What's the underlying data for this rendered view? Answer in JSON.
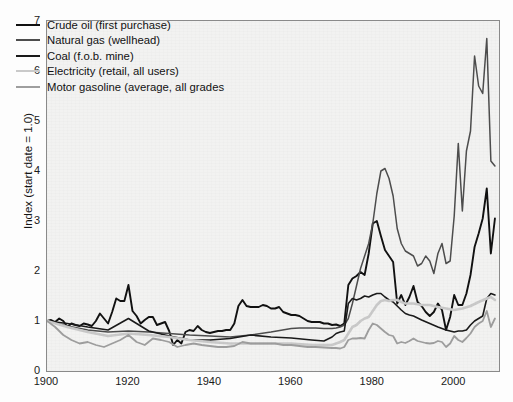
{
  "chart_data": {
    "type": "line",
    "title": "",
    "xlabel": "",
    "ylabel": "Index (start date = 1.0)",
    "xlim": [
      1900,
      2011
    ],
    "ylim": [
      0,
      7
    ],
    "xticks": [
      1900,
      1920,
      1940,
      1960,
      1980,
      2000
    ],
    "yticks": [
      0,
      1,
      2,
      3,
      4,
      5,
      6,
      7
    ],
    "grid": false,
    "legend_position": "upper left",
    "background_color": "#f2f2f1",
    "series": [
      {
        "name": "Crude oil (first purchase)",
        "color": "#111111",
        "width": 1.9,
        "x": [
          1900,
          1901,
          1902,
          1903,
          1904,
          1905,
          1906,
          1907,
          1908,
          1909,
          1910,
          1911,
          1912,
          1913,
          1914,
          1915,
          1916,
          1917,
          1918,
          1919,
          1920,
          1921,
          1922,
          1923,
          1924,
          1925,
          1926,
          1927,
          1928,
          1929,
          1930,
          1931,
          1932,
          1933,
          1934,
          1935,
          1936,
          1937,
          1938,
          1939,
          1940,
          1941,
          1942,
          1943,
          1944,
          1945,
          1946,
          1947,
          1948,
          1949,
          1950,
          1951,
          1952,
          1953,
          1954,
          1955,
          1956,
          1957,
          1958,
          1959,
          1960,
          1961,
          1962,
          1963,
          1964,
          1965,
          1966,
          1967,
          1968,
          1969,
          1970,
          1971,
          1972,
          1973,
          1974,
          1975,
          1976,
          1977,
          1978,
          1979,
          1980,
          1981,
          1982,
          1983,
          1984,
          1985,
          1986,
          1987,
          1988,
          1989,
          1990,
          1991,
          1992,
          1993,
          1994,
          1995,
          1996,
          1997,
          1998,
          1999,
          2000,
          2001,
          2002,
          2003,
          2004,
          2005,
          2006,
          2007,
          2008,
          2009,
          2010
        ],
        "values": [
          1.0,
          1.02,
          0.98,
          1.05,
          1.0,
          0.88,
          0.95,
          0.92,
          0.9,
          0.95,
          0.93,
          0.9,
          1.0,
          1.15,
          1.05,
          0.95,
          1.18,
          1.45,
          1.4,
          1.4,
          1.72,
          1.2,
          1.1,
          0.95,
          1.02,
          1.08,
          1.08,
          0.92,
          0.95,
          0.98,
          0.8,
          0.52,
          0.62,
          0.55,
          0.78,
          0.82,
          0.8,
          0.9,
          0.82,
          0.78,
          0.76,
          0.78,
          0.8,
          0.8,
          0.82,
          0.82,
          0.95,
          1.3,
          1.42,
          1.3,
          1.28,
          1.28,
          1.28,
          1.32,
          1.3,
          1.25,
          1.25,
          1.28,
          1.18,
          1.15,
          1.12,
          1.12,
          1.1,
          1.05,
          1.0,
          0.98,
          0.98,
          0.98,
          0.95,
          0.95,
          0.92,
          0.93,
          0.9,
          0.95,
          1.72,
          1.85,
          1.9,
          1.98,
          1.92,
          2.35,
          2.95,
          3.0,
          2.7,
          2.42,
          2.3,
          2.18,
          1.35,
          1.52,
          1.32,
          1.48,
          1.7,
          1.38,
          1.3,
          1.18,
          1.1,
          1.18,
          1.35,
          1.22,
          0.82,
          1.08,
          1.52,
          1.32,
          1.32,
          1.55,
          1.92,
          2.48,
          2.75,
          3.05,
          3.65,
          2.35,
          3.05
        ]
      },
      {
        "name": "Natural gas (wellhead)",
        "color": "#4d4d4d",
        "width": 1.5,
        "x": [
          1900,
          1905,
          1910,
          1915,
          1920,
          1925,
          1930,
          1935,
          1940,
          1945,
          1950,
          1955,
          1960,
          1962,
          1964,
          1966,
          1968,
          1970,
          1971,
          1972,
          1973,
          1974,
          1975,
          1976,
          1977,
          1978,
          1979,
          1980,
          1981,
          1982,
          1983,
          1984,
          1985,
          1986,
          1987,
          1988,
          1989,
          1990,
          1991,
          1992,
          1993,
          1994,
          1995,
          1996,
          1997,
          1998,
          1999,
          2000,
          2001,
          2002,
          2003,
          2004,
          2005,
          2006,
          2007,
          2008,
          2009,
          2010
        ],
        "values": [
          1.0,
          0.9,
          0.82,
          0.78,
          0.8,
          0.78,
          0.75,
          0.72,
          0.7,
          0.68,
          0.72,
          0.78,
          0.85,
          0.86,
          0.86,
          0.86,
          0.85,
          0.85,
          0.86,
          0.88,
          0.92,
          1.05,
          1.35,
          1.7,
          2.05,
          2.3,
          2.55,
          2.95,
          3.55,
          4.0,
          4.05,
          3.85,
          3.5,
          2.85,
          2.55,
          2.4,
          2.35,
          2.3,
          2.1,
          2.15,
          2.3,
          2.2,
          1.95,
          2.35,
          2.55,
          2.15,
          2.2,
          3.1,
          4.55,
          3.2,
          4.4,
          4.8,
          6.3,
          5.7,
          5.55,
          6.65,
          4.2,
          4.1
        ]
      },
      {
        "name": "Coal (f.o.b. mine)",
        "color": "#1a1a1a",
        "width": 1.6,
        "x": [
          1900,
          1905,
          1910,
          1915,
          1920,
          1925,
          1930,
          1935,
          1940,
          1945,
          1950,
          1955,
          1960,
          1965,
          1968,
          1970,
          1971,
          1972,
          1973,
          1974,
          1975,
          1976,
          1977,
          1978,
          1979,
          1980,
          1981,
          1982,
          1983,
          1984,
          1985,
          1986,
          1987,
          1988,
          1989,
          1990,
          1992,
          1994,
          1996,
          1998,
          2000,
          2001,
          2002,
          2003,
          2004,
          2005,
          2006,
          2007,
          2008,
          2009,
          2010
        ],
        "values": [
          1.0,
          0.95,
          0.88,
          0.82,
          1.05,
          0.8,
          0.7,
          0.62,
          0.62,
          0.65,
          0.72,
          0.68,
          0.66,
          0.62,
          0.6,
          0.68,
          0.75,
          0.78,
          0.8,
          1.35,
          1.45,
          1.42,
          1.45,
          1.5,
          1.48,
          1.52,
          1.55,
          1.55,
          1.48,
          1.42,
          1.38,
          1.3,
          1.22,
          1.15,
          1.12,
          1.1,
          1.02,
          0.95,
          0.88,
          0.82,
          0.78,
          0.8,
          0.8,
          0.82,
          0.92,
          1.0,
          1.05,
          1.1,
          1.45,
          1.55,
          1.52
        ]
      },
      {
        "name": "Electricity (retail, all users)",
        "color": "#c9c9c9",
        "width": 2.6,
        "x": [
          1900,
          1905,
          1910,
          1915,
          1920,
          1925,
          1930,
          1935,
          1940,
          1945,
          1950,
          1955,
          1960,
          1965,
          1970,
          1971,
          1972,
          1973,
          1974,
          1975,
          1976,
          1977,
          1978,
          1979,
          1980,
          1981,
          1982,
          1983,
          1984,
          1985,
          1986,
          1987,
          1988,
          1989,
          1990,
          1992,
          1994,
          1996,
          1998,
          2000,
          2002,
          2004,
          2006,
          2008,
          2009,
          2010
        ],
        "values": [
          1.0,
          0.88,
          0.78,
          0.7,
          0.75,
          0.72,
          0.68,
          0.62,
          0.58,
          0.55,
          0.55,
          0.55,
          0.55,
          0.52,
          0.52,
          0.55,
          0.58,
          0.62,
          0.75,
          0.88,
          0.92,
          1.0,
          1.05,
          1.08,
          1.2,
          1.32,
          1.4,
          1.42,
          1.4,
          1.42,
          1.42,
          1.38,
          1.35,
          1.35,
          1.35,
          1.32,
          1.32,
          1.28,
          1.25,
          1.22,
          1.25,
          1.3,
          1.38,
          1.45,
          1.48,
          1.42
        ]
      },
      {
        "name": "Motor gasoline (average, all grades",
        "color": "#9e9e9e",
        "width": 1.8,
        "x": [
          1900,
          1902,
          1904,
          1906,
          1908,
          1910,
          1912,
          1914,
          1916,
          1918,
          1920,
          1922,
          1924,
          1926,
          1928,
          1930,
          1932,
          1934,
          1936,
          1938,
          1940,
          1942,
          1944,
          1946,
          1948,
          1950,
          1952,
          1954,
          1956,
          1958,
          1960,
          1962,
          1964,
          1966,
          1968,
          1970,
          1971,
          1972,
          1973,
          1974,
          1975,
          1976,
          1977,
          1978,
          1979,
          1980,
          1981,
          1982,
          1983,
          1984,
          1985,
          1986,
          1987,
          1988,
          1989,
          1990,
          1991,
          1992,
          1993,
          1994,
          1995,
          1996,
          1997,
          1998,
          1999,
          2000,
          2001,
          2002,
          2003,
          2004,
          2005,
          2006,
          2007,
          2008,
          2009,
          2010
        ],
        "values": [
          1.0,
          0.88,
          0.72,
          0.62,
          0.55,
          0.58,
          0.52,
          0.48,
          0.55,
          0.62,
          0.72,
          0.58,
          0.52,
          0.65,
          0.62,
          0.58,
          0.48,
          0.52,
          0.55,
          0.52,
          0.5,
          0.48,
          0.48,
          0.5,
          0.58,
          0.55,
          0.55,
          0.55,
          0.55,
          0.52,
          0.52,
          0.5,
          0.48,
          0.48,
          0.47,
          0.46,
          0.46,
          0.45,
          0.48,
          0.62,
          0.65,
          0.65,
          0.66,
          0.65,
          0.82,
          0.95,
          0.92,
          0.85,
          0.78,
          0.72,
          0.7,
          0.55,
          0.58,
          0.56,
          0.6,
          0.65,
          0.6,
          0.58,
          0.56,
          0.55,
          0.56,
          0.6,
          0.58,
          0.48,
          0.55,
          0.7,
          0.62,
          0.58,
          0.66,
          0.75,
          0.88,
          0.95,
          1.0,
          1.2,
          0.88,
          1.05
        ]
      }
    ]
  },
  "axis": {
    "ytick_labels": [
      "0",
      "1",
      "2",
      "3",
      "4",
      "5",
      "6",
      "7"
    ],
    "xtick_labels": [
      "1900",
      "1920",
      "1940",
      "1960",
      "1980",
      "2000"
    ],
    "ylabel": "Index (start date = 1.0)"
  },
  "legend": {
    "items": [
      {
        "label": "Crude oil (first purchase)"
      },
      {
        "label": "Natural gas (wellhead)"
      },
      {
        "label": "Coal (f.o.b. mine)"
      },
      {
        "label": "Electricity (retail, all users)"
      },
      {
        "label": "Motor gasoline (average, all grades"
      }
    ]
  }
}
